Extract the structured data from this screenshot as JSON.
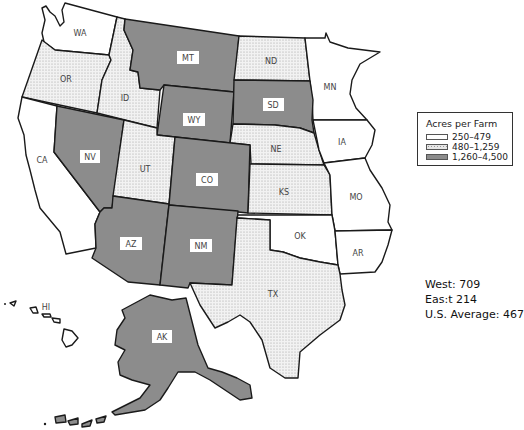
{
  "legend": {
    "title": "Acres per Farm",
    "items": [
      {
        "label": "250–479",
        "fill": "#ffffff",
        "pattern": "none"
      },
      {
        "label": "480–1,259",
        "fill": "#eeeeee",
        "pattern": "dots"
      },
      {
        "label": "1,260–4,500",
        "fill": "#8c8c8c",
        "pattern": "none"
      }
    ]
  },
  "stats": {
    "west": "West:  709",
    "east": "Eas:t  214",
    "us_average": "U.S. Average:  467"
  },
  "states": {
    "WA": {
      "label": "WA",
      "category": 0
    },
    "OR": {
      "label": "OR",
      "category": 1
    },
    "ID": {
      "label": "ID",
      "category": 1
    },
    "MT": {
      "label": "MT",
      "category": 2
    },
    "ND": {
      "label": "ND",
      "category": 1
    },
    "MN": {
      "label": "MN",
      "category": 0
    },
    "WY": {
      "label": "WY",
      "category": 2
    },
    "SD": {
      "label": "SD",
      "category": 2
    },
    "IA": {
      "label": "IA",
      "category": 0
    },
    "CA": {
      "label": "CA",
      "category": 0
    },
    "NV": {
      "label": "NV",
      "category": 2
    },
    "UT": {
      "label": "UT",
      "category": 0
    },
    "CO": {
      "label": "CO",
      "category": 2
    },
    "NE": {
      "label": "NE",
      "category": 1
    },
    "KS": {
      "label": "KS",
      "category": 1
    },
    "MO": {
      "label": "MO",
      "category": 0
    },
    "AZ": {
      "label": "AZ",
      "category": 2
    },
    "NM": {
      "label": "NM",
      "category": 2
    },
    "OK": {
      "label": "OK",
      "category": 0
    },
    "AR": {
      "label": "AR",
      "category": 0
    },
    "TX": {
      "label": "TX",
      "category": 1
    },
    "AK": {
      "label": "AK",
      "category": 2
    },
    "HI": {
      "label": "HI",
      "category": 0
    }
  },
  "colors": {
    "low": "#ffffff",
    "mid": "#eeeeee",
    "high": "#8c8c8c",
    "border": "#1a1a1a"
  }
}
